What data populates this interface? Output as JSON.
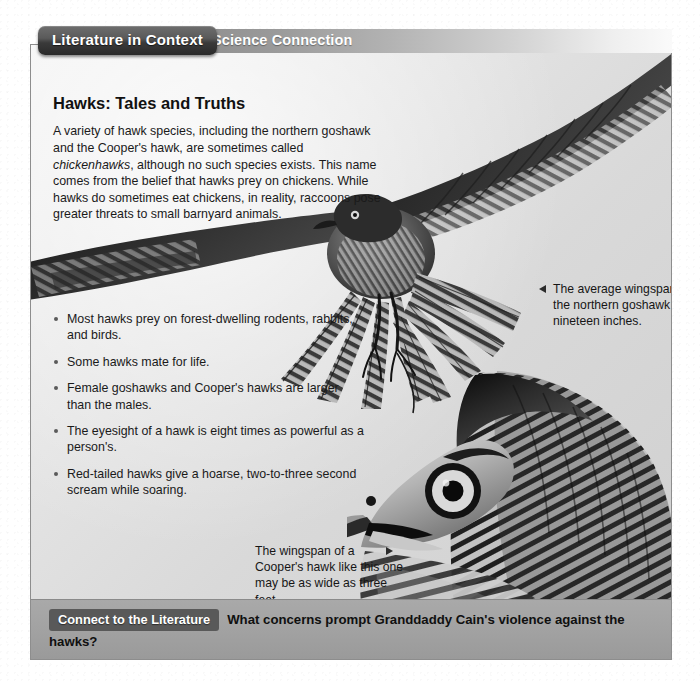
{
  "header": {
    "tab_label": "Literature in Context",
    "section_label": "Science Connection"
  },
  "article": {
    "headline": "Hawks: Tales and Truths",
    "intro_plain": "A variety of hawk species, including the northern goshawk and the Cooper's hawk, are sometimes called chickenhawks, although no such species exists. This name comes from the belief that hawks prey on chickens. While hawks do sometimes eat chickens, in reality, raccoons pose greater threats to small barnyard animals.",
    "intro_parts": {
      "before_italic": "A variety of hawk species, including the northern goshawk and the Cooper's hawk, are sometimes called ",
      "italic": "chickenhawks",
      "after_italic": ", although no such species exists. This name comes from the belief that hawks prey on chickens. While hawks do sometimes eat chickens, in reality, raccoons pose greater threats to small barnyard animals."
    },
    "facts": [
      "Most hawks prey on forest-dwelling rodents, rabbits, and birds.",
      "Some hawks mate for life.",
      "Female goshawks and Cooper's hawks are larger than the males.",
      "The eyesight of a hawk is eight times as powerful as a person's.",
      "Red-tailed hawks give a hoarse, two-to-three second scream while soaring."
    ]
  },
  "captions": {
    "goshawk": {
      "text": "The average wingspan of the northern goshawk is nineteen inches.",
      "arrow_icon": "triangle-left-icon"
    },
    "coopers": {
      "text": "The wingspan of a Cooper's hawk like this one may be as wide as three feet.",
      "arrow_icon": "triangle-right-icon"
    }
  },
  "images": {
    "flying_hawk_alt": "northern goshawk in flight with wings fully spread",
    "hawk_head_alt": "close-up profile of a Cooper's hawk head"
  },
  "footer": {
    "chip_label": "Connect to the Literature",
    "question": "What concerns prompt Granddaddy Cain's violence against the hawks?"
  },
  "colors": {
    "tab_dark": "#3a3a3a",
    "section_bar": "#9a9a9a",
    "panel_light": "#f2f2f2",
    "panel_dark": "#cfcfcf",
    "footer_band": "#a2a2a2",
    "chip": "#595959",
    "text": "#1a1a1a"
  }
}
